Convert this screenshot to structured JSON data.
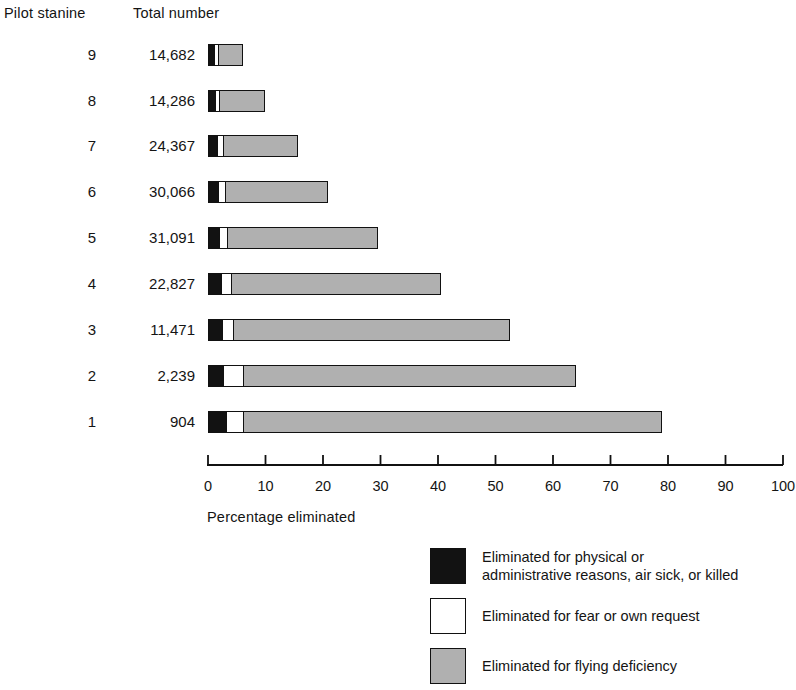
{
  "headers": {
    "stanine": "Pilot stanine",
    "total": "Total number"
  },
  "axis": {
    "title": "Percentage eliminated",
    "ticks": [
      "0",
      "10",
      "20",
      "30",
      "40",
      "50",
      "60",
      "70",
      "80",
      "90",
      "100"
    ]
  },
  "legend": {
    "items": [
      {
        "swatch": "black",
        "label": "Eliminated for physical or\nadministrative reasons, air sick, or killed"
      },
      {
        "swatch": "white",
        "label": "Eliminated for fear or own request"
      },
      {
        "swatch": "gray",
        "label": "Eliminated for flying deficiency"
      }
    ]
  },
  "colors": {
    "black": "#121212",
    "white": "#ffffff",
    "gray": "#b0b0b0",
    "outline": "#111111",
    "background": "#ffffff"
  },
  "chart_data": {
    "type": "bar",
    "orientation": "horizontal",
    "stacked": true,
    "title": "",
    "xlabel": "Percentage eliminated",
    "ylabel": "Pilot stanine",
    "xlim": [
      0,
      100
    ],
    "xticks": [
      0,
      10,
      20,
      30,
      40,
      50,
      60,
      70,
      80,
      90,
      100
    ],
    "grid": false,
    "legend_position": "bottom-right",
    "categories": [
      "9",
      "8",
      "7",
      "6",
      "5",
      "4",
      "3",
      "2",
      "1"
    ],
    "extra_columns": {
      "Total number": [
        "14,682",
        "14,286",
        "24,367",
        "30,066",
        "31,091",
        "22,827",
        "11,471",
        "2,239",
        "904"
      ]
    },
    "series": [
      {
        "name": "Eliminated for physical or administrative reasons, air sick, or killed",
        "color": "#121212",
        "values": [
          0.9,
          1.0,
          1.4,
          1.6,
          1.8,
          2.1,
          2.2,
          2.4,
          3.0
        ]
      },
      {
        "name": "Eliminated for fear or own request",
        "color": "#ffffff",
        "values": [
          0.9,
          1.0,
          1.2,
          1.4,
          1.5,
          1.9,
          2.1,
          3.8,
          3.1
        ]
      },
      {
        "name": "Eliminated for flying deficiency",
        "color": "#b0b0b0",
        "values": [
          4.3,
          7.9,
          13.0,
          17.8,
          26.3,
          36.5,
          48.2,
          57.8,
          72.9
        ]
      }
    ],
    "totals_percent": [
      6.1,
      9.9,
      15.6,
      20.8,
      29.6,
      40.5,
      52.5,
      64.0,
      79.0
    ],
    "rows": [
      {
        "stanine": "9",
        "total": "14,682",
        "black": 0.9,
        "white": 0.9,
        "gray": 4.3
      },
      {
        "stanine": "8",
        "total": "14,286",
        "black": 1.0,
        "white": 1.0,
        "gray": 7.9
      },
      {
        "stanine": "7",
        "total": "24,367",
        "black": 1.4,
        "white": 1.2,
        "gray": 13.0
      },
      {
        "stanine": "6",
        "total": "30,066",
        "black": 1.6,
        "white": 1.4,
        "gray": 17.8
      },
      {
        "stanine": "5",
        "total": "31,091",
        "black": 1.8,
        "white": 1.5,
        "gray": 26.3
      },
      {
        "stanine": "4",
        "total": "22,827",
        "black": 2.1,
        "white": 1.9,
        "gray": 36.5
      },
      {
        "stanine": "3",
        "total": "11,471",
        "black": 2.2,
        "white": 2.1,
        "gray": 48.2
      },
      {
        "stanine": "2",
        "total": "2,239",
        "black": 2.4,
        "white": 3.8,
        "gray": 57.8
      },
      {
        "stanine": "1",
        "total": "904",
        "black": 3.0,
        "white": 3.1,
        "gray": 72.9
      }
    ]
  }
}
